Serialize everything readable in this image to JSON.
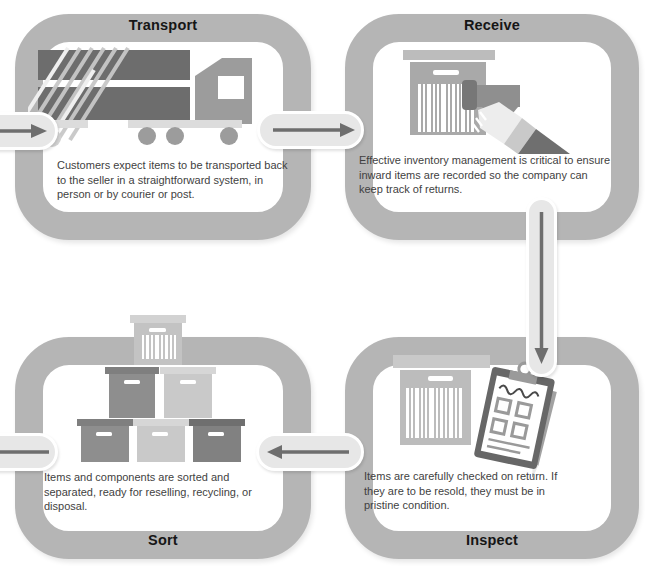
{
  "stages": {
    "transport": {
      "title": "Transport",
      "description": "Customers expect items to be transported back to the seller in a straightforward system, in person or by courier or post.",
      "icon": "truck-icon"
    },
    "receive": {
      "title": "Receive",
      "description": "Effective inventory management is critical to ensure inward items are recorded so the company can keep track of returns.",
      "icon": "barcode-scanner-box-icon"
    },
    "inspect": {
      "title": "Inspect",
      "description": "Items are carefully checked on return. If they are to be resold, they must be in pristine condition.",
      "icon": "clipboard-checklist-box-icon"
    },
    "sort": {
      "title": "Sort",
      "description": "Items and components are sorted and separated, ready for reselling, recycling, or disposal.",
      "icon": "stacked-boxes-icon"
    }
  },
  "connectors": [
    {
      "id": "flow-in",
      "direction": "right",
      "from": "outside",
      "to": "transport"
    },
    {
      "id": "transport-to-receive",
      "direction": "right",
      "from": "transport",
      "to": "receive"
    },
    {
      "id": "receive-to-inspect",
      "direction": "down",
      "from": "receive",
      "to": "inspect"
    },
    {
      "id": "inspect-to-sort",
      "direction": "left",
      "from": "inspect",
      "to": "sort"
    },
    {
      "id": "flow-out",
      "direction": "left",
      "from": "sort",
      "to": "outside"
    }
  ],
  "colors": {
    "loop_border": "#b5b5b5",
    "pill_background": "#e7e7e7",
    "arrow": "#6e6e6e",
    "title_text": "#161616",
    "body_text": "#3f3f3f",
    "background": "#ffffff"
  }
}
